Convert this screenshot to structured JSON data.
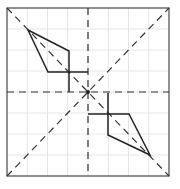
{
  "diagram": {
    "type": "geometry-symmetry-figure",
    "frame": {
      "x1": 7,
      "y1": 8,
      "x2": 169,
      "y2": 176
    },
    "grid_divisions": 8,
    "center": [
      88,
      92
    ],
    "colors": {
      "grid": "#e4e4e4",
      "frame": "#555555",
      "lines": "#222222"
    },
    "shape_upper_left": {
      "points": [
        [
          28,
          30
        ],
        [
          69,
          51
        ],
        [
          69,
          72
        ],
        [
          48,
          72
        ]
      ],
      "helper_segments": [
        [
          [
            69,
            72
          ],
          [
            69,
            92
          ]
        ],
        [
          [
            69,
            72
          ],
          [
            88,
            72
          ]
        ]
      ]
    },
    "shape_lower_right": {
      "points": [
        [
          150,
          155
        ],
        [
          108,
          135
        ],
        [
          108,
          114
        ],
        [
          129,
          114
        ]
      ],
      "helper_segments": [
        [
          [
            108,
            114
          ],
          [
            108,
            93
          ]
        ],
        [
          [
            108,
            114
          ],
          [
            88,
            114
          ]
        ]
      ]
    }
  }
}
